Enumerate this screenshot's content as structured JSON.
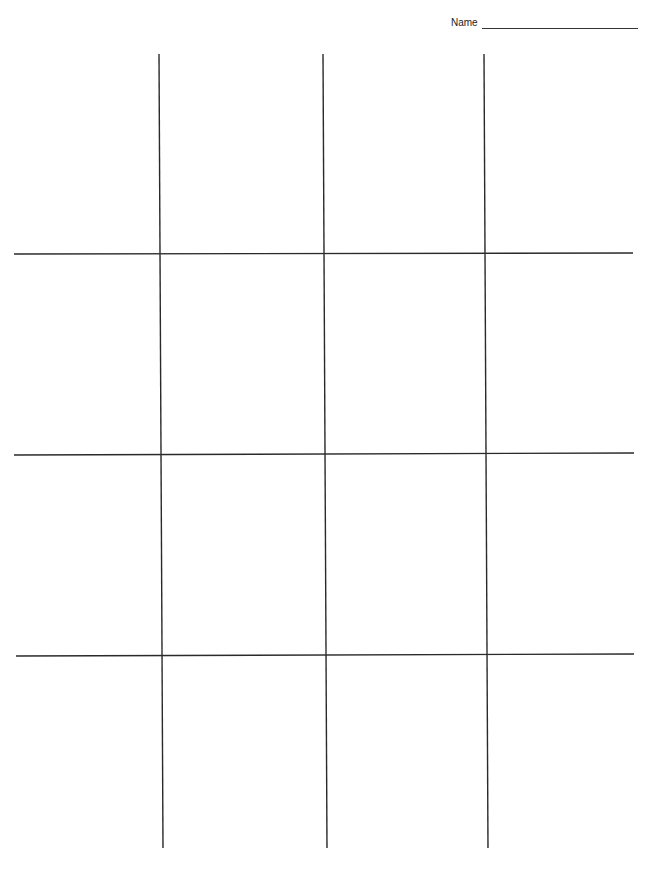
{
  "header": {
    "name_label": "Name",
    "name_value": ""
  },
  "grid": {
    "rows": 4,
    "columns": 4,
    "line_color": "#2a2a2a",
    "vertical_lines": [
      {
        "x1": 159,
        "y1": 54,
        "x2": 163,
        "y2": 848
      },
      {
        "x1": 323,
        "y1": 54,
        "x2": 327,
        "y2": 848
      },
      {
        "x1": 484,
        "y1": 54,
        "x2": 488,
        "y2": 848
      }
    ],
    "horizontal_lines": [
      {
        "x1": 14,
        "y1": 254,
        "x2": 633,
        "y2": 253
      },
      {
        "x1": 14,
        "y1": 455,
        "x2": 634,
        "y2": 453
      },
      {
        "x1": 16,
        "y1": 656,
        "x2": 634,
        "y2": 654
      }
    ]
  }
}
